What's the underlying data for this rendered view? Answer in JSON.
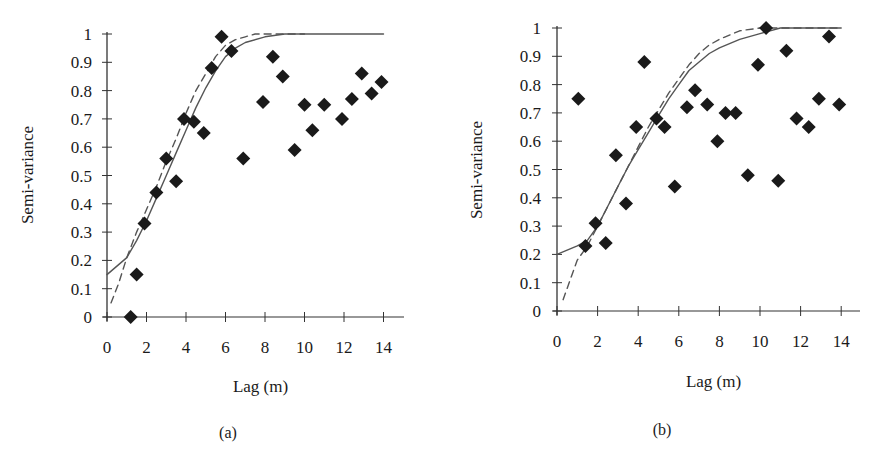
{
  "figure": {
    "panels": [
      {
        "id": "a",
        "caption": "(a)",
        "xlabel": "Lag (m)",
        "ylabel": "Semi-variance"
      },
      {
        "id": "b",
        "caption": "(b)",
        "xlabel": "Lag (m)",
        "ylabel": "Semi-variance"
      }
    ]
  },
  "chart_data": [
    {
      "type": "scatter",
      "title": "(a)",
      "xlabel": "Lag (m)",
      "ylabel": "Semi-variance",
      "xlim": [
        0,
        15
      ],
      "ylim": [
        0,
        1
      ],
      "xticks": [
        0,
        2,
        4,
        6,
        8,
        10,
        12,
        14
      ],
      "yticks": [
        0,
        0.1,
        0.2,
        0.3,
        0.4,
        0.5,
        0.6,
        0.7,
        0.8,
        0.9,
        1
      ],
      "ytick_labels": [
        "0",
        "0.1",
        "0.2",
        "0.3",
        "0.4",
        "0.5",
        "0.6",
        "0.7",
        "0.8",
        "0.9",
        "1"
      ],
      "grid": false,
      "legend": null,
      "series": [
        {
          "name": "Experimental semi-variance",
          "marker": "diamond",
          "color": "#1a1a1a",
          "x": [
            1.2,
            1.5,
            1.9,
            2.5,
            3.0,
            3.5,
            3.9,
            4.4,
            4.9,
            5.3,
            5.8,
            6.3,
            6.9,
            7.9,
            8.4,
            8.9,
            9.5,
            10.0,
            10.4,
            11.0,
            11.9,
            12.4,
            12.9,
            13.4,
            13.9
          ],
          "y": [
            0.0,
            0.15,
            0.33,
            0.44,
            0.56,
            0.48,
            0.7,
            0.69,
            0.65,
            0.88,
            0.99,
            0.94,
            0.56,
            0.76,
            0.92,
            0.85,
            0.59,
            0.75,
            0.66,
            0.75,
            0.7,
            0.77,
            0.86,
            0.79,
            0.83
          ]
        },
        {
          "name": "Model fit (solid)",
          "style": "solid",
          "color": "#555555",
          "x": [
            0,
            1,
            1.5,
            2,
            2.5,
            3,
            3.5,
            4,
            4.5,
            5,
            5.5,
            6,
            6.5,
            7,
            8,
            9,
            10,
            11,
            12,
            13,
            14
          ],
          "y": [
            0.15,
            0.21,
            0.27,
            0.34,
            0.42,
            0.5,
            0.58,
            0.66,
            0.74,
            0.81,
            0.87,
            0.92,
            0.95,
            0.97,
            0.99,
            1.0,
            1.0,
            1.0,
            1.0,
            1.0,
            1.0
          ]
        },
        {
          "name": "Model fit (dashed)",
          "style": "dashed",
          "color": "#555555",
          "x": [
            0.2,
            0.6,
            1,
            1.5,
            2,
            2.5,
            3,
            3.5,
            4,
            4.5,
            5,
            5.5,
            6,
            6.5,
            7,
            7.5,
            8,
            9,
            10
          ],
          "y": [
            0.05,
            0.12,
            0.21,
            0.3,
            0.38,
            0.46,
            0.55,
            0.63,
            0.72,
            0.8,
            0.86,
            0.92,
            0.96,
            0.98,
            0.99,
            1.0,
            1.0,
            1.0,
            1.0
          ]
        }
      ]
    },
    {
      "type": "scatter",
      "title": "(b)",
      "xlabel": "Lag (m)",
      "ylabel": "Semi-variance",
      "xlim": [
        0,
        15
      ],
      "ylim": [
        0,
        1
      ],
      "xticks": [
        0,
        2,
        4,
        6,
        8,
        10,
        12,
        14
      ],
      "yticks": [
        0,
        0.1,
        0.2,
        0.3,
        0.4,
        0.5,
        0.6,
        0.7,
        0.8,
        0.9,
        1
      ],
      "ytick_labels": [
        "0",
        "0.1",
        "0.2",
        "0.3",
        "0.4",
        "0.5",
        "0.6",
        "0.7",
        "0.8",
        "0.9",
        "1"
      ],
      "grid": false,
      "legend": null,
      "series": [
        {
          "name": "Experimental semi-variance",
          "marker": "diamond",
          "color": "#1a1a1a",
          "x": [
            1.05,
            1.4,
            1.9,
            2.4,
            2.9,
            3.4,
            3.9,
            4.3,
            4.9,
            5.3,
            5.8,
            6.4,
            6.8,
            7.4,
            7.9,
            8.3,
            8.8,
            9.4,
            9.9,
            10.3,
            10.9,
            11.3,
            11.8,
            12.4,
            12.9,
            13.4,
            13.9
          ],
          "y": [
            0.75,
            0.23,
            0.31,
            0.24,
            0.55,
            0.38,
            0.65,
            0.88,
            0.68,
            0.65,
            0.44,
            0.72,
            0.78,
            0.73,
            0.6,
            0.7,
            0.7,
            0.48,
            0.87,
            1.0,
            0.46,
            0.92,
            0.68,
            0.65,
            0.75,
            0.97,
            0.73
          ]
        },
        {
          "name": "Model fit (solid)",
          "style": "solid",
          "color": "#555555",
          "x": [
            0,
            1,
            1.5,
            2,
            2.5,
            3,
            3.5,
            4,
            4.5,
            5,
            5.5,
            6,
            6.5,
            7,
            7.5,
            8,
            9,
            10,
            11,
            12,
            13,
            14
          ],
          "y": [
            0.2,
            0.23,
            0.25,
            0.3,
            0.37,
            0.44,
            0.51,
            0.57,
            0.63,
            0.69,
            0.75,
            0.8,
            0.85,
            0.88,
            0.91,
            0.93,
            0.96,
            0.98,
            1.0,
            1.0,
            1.0,
            1.0
          ]
        },
        {
          "name": "Model fit (dashed)",
          "style": "dashed",
          "color": "#555555",
          "x": [
            0.3,
            0.7,
            1,
            1.5,
            2,
            2.5,
            3,
            3.5,
            4,
            4.5,
            5,
            5.5,
            6,
            6.5,
            7,
            7.5,
            8,
            9,
            10,
            11,
            12,
            14
          ],
          "y": [
            0.04,
            0.12,
            0.18,
            0.23,
            0.3,
            0.37,
            0.44,
            0.51,
            0.58,
            0.65,
            0.71,
            0.77,
            0.82,
            0.87,
            0.91,
            0.94,
            0.96,
            0.99,
            1.0,
            1.0,
            1.0,
            1.0
          ]
        }
      ]
    }
  ]
}
